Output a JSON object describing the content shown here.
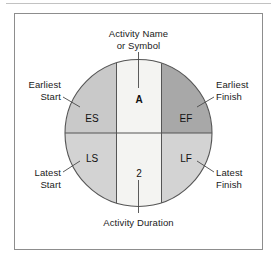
{
  "figure": {
    "node": {
      "activity_symbol": "A",
      "activity_duration": "2",
      "quadrants": [
        {
          "key": "es",
          "label": "ES",
          "position": "upper-left",
          "fill": "#c9c9c9"
        },
        {
          "key": "ef",
          "label": "EF",
          "position": "upper-right",
          "fill": "#a8a8a8"
        },
        {
          "key": "ls",
          "label": "LS",
          "position": "lower-left",
          "fill": "#d3d3d3"
        },
        {
          "key": "lf",
          "label": "LF",
          "position": "lower-right",
          "fill": "#d3d3d3"
        }
      ],
      "center_band_fill": "#f4f4f2"
    },
    "callouts": {
      "activity_name": {
        "line1": "Activity Name",
        "line2": "or Symbol"
      },
      "earliest_start": {
        "line1": "Earliest",
        "line2": "Start"
      },
      "earliest_finish": {
        "line1": "Earliest",
        "line2": "Finish"
      },
      "latest_start": {
        "line1": "Latest",
        "line2": "Start"
      },
      "latest_finish": {
        "line1": "Latest",
        "line2": "Finish"
      },
      "activity_duration": {
        "line1": "Activity Duration"
      }
    },
    "colors": {
      "frame_border": "#8d8d8d",
      "top_rule": "#c2c2c2",
      "circle_stroke": "#555555",
      "divider_stroke": "#555555",
      "leader_stroke": "#4a4a4a",
      "text": "#1a1a1a",
      "background": "#ffffff"
    }
  }
}
